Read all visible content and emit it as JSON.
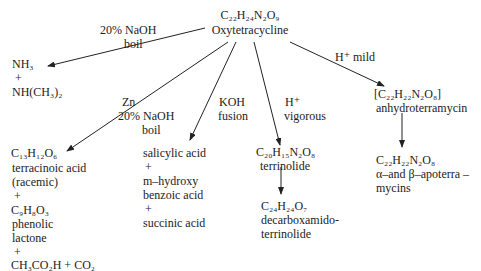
{
  "center": {
    "formula": "C₂₂H₂₄N₂O₉",
    "name": "Oxytetracycline"
  },
  "conditions": {
    "naoh_boil_left": {
      "line1": "20% NaOH",
      "line2": "boil"
    },
    "zn_naoh": {
      "line1": "Zn",
      "line2": "20% NaOH",
      "line3": "boil"
    },
    "koh_fusion": {
      "line1": "KOH",
      "line2": "fusion"
    },
    "h_vigorous": {
      "line1": "H⁺",
      "line2": "vigorous"
    },
    "h_mild": {
      "line1": "H⁺ mild"
    }
  },
  "products": {
    "amines": {
      "lines": [
        "NH₃",
        "+",
        "NH(CH₃)₂"
      ]
    },
    "terracinoic": {
      "lines": [
        "C₁₃H₁₂O₆",
        "terracinoic acid",
        "(racemic)",
        "+",
        "C₉H₈O₃",
        "phenolic",
        "lactone",
        "+",
        "CH₃CO₂H  +  CO₂"
      ]
    },
    "salicylic": {
      "lines": [
        "salicylic acid",
        "+",
        "m–hydroxy",
        "benzoic acid",
        "+",
        "succinic acid"
      ]
    },
    "terrinolide": {
      "lines": [
        "C₂₀H₁₅N₂O₈",
        "terrinolide"
      ]
    },
    "decarboxamido": {
      "lines": [
        "C₂₄H₂₄O₇",
        "decarboxamido-",
        "terrinolide"
      ]
    },
    "anhydro": {
      "lines": [
        "[C₂₂H₂₂N₂O₈]",
        "anhydroterramycin"
      ]
    },
    "apoterramycins": {
      "lines": [
        "C₂₂H₂₂N₂O₈",
        "α–and β–apoterra –",
        "mycins"
      ]
    }
  },
  "colors": {
    "ink": "#222222",
    "background": "#ffffff"
  }
}
